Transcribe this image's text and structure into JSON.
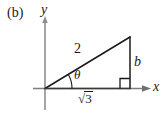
{
  "figure": {
    "panel_label": "(b)",
    "axes": {
      "x_label": "x",
      "y_label": "y",
      "x_axis_color": "#3c3c3c",
      "y_axis_color": "#8a8a8a"
    },
    "triangle": {
      "stroke_color": "#1a1a1a",
      "hypotenuse_label": "2",
      "vertical_leg_label": "b",
      "horizontal_leg_radical_sign": "√",
      "horizontal_leg_radicand": "3",
      "horizontal_leg_label": "√3",
      "angle_label": "θ",
      "right_angle_marker": "right-angle"
    }
  }
}
